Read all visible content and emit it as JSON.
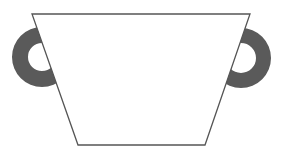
{
  "figure": {
    "title": "Cup with two handles",
    "colors": {
      "background": "#ffffff",
      "cup_fill": "#ffffff",
      "cup_stroke": "#555555",
      "handle_fill": "#5a5a5a"
    },
    "cup": {
      "top_left": [
        32,
        14
      ],
      "top_right": [
        250,
        14
      ],
      "bottom_right": [
        205,
        145
      ],
      "bottom_left": [
        78,
        145
      ]
    },
    "handles": [
      {
        "side": "left",
        "cx": 42,
        "cy": 57,
        "outer_r": 30,
        "inner_r": 14
      },
      {
        "side": "right",
        "cx": 241,
        "cy": 58,
        "outer_r": 30,
        "inner_r": 15
      }
    ]
  }
}
